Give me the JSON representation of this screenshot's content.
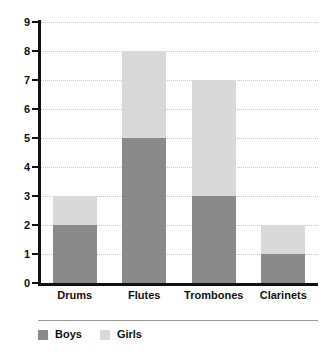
{
  "chart_data": {
    "type": "bar",
    "stacked": true,
    "title": "",
    "subtitle": "",
    "xlabel": "",
    "ylabel": "",
    "categories": [
      "Drums",
      "Flutes",
      "Trombones",
      "Clarinets"
    ],
    "series": [
      {
        "name": "Boys",
        "values": [
          2,
          5,
          3,
          1
        ],
        "color": "#8a8a8a"
      },
      {
        "name": "Girls",
        "values": [
          1,
          3,
          4,
          1
        ],
        "color": "#d9d9d9"
      }
    ],
    "totals": [
      3,
      8,
      7,
      2
    ],
    "ylim": [
      0,
      9
    ],
    "ytick_labels": [
      "0",
      "1",
      "2",
      "3",
      "4",
      "5",
      "6",
      "7",
      "8",
      "9"
    ],
    "ytick_values": [
      0,
      1,
      2,
      3,
      4,
      5,
      6,
      7,
      8,
      9
    ],
    "grid": true,
    "grid_axis": "y",
    "grid_style": "dotted",
    "grid_color": "#c9c9c9",
    "legend_position": "bottom-left",
    "axis_color": "#111111",
    "background_color": "#ffffff"
  },
  "legend": {
    "items": [
      {
        "label": "Boys",
        "swatch_name": "legend-swatch-boys"
      },
      {
        "label": "Girls",
        "swatch_name": "legend-swatch-girls"
      }
    ]
  }
}
